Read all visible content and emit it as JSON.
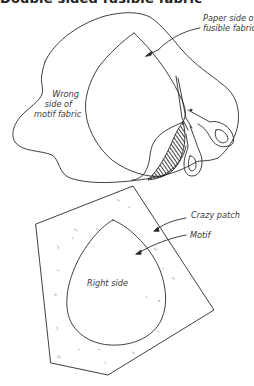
{
  "title": "Double sided fusible fabric",
  "figure_top": {
    "labels": {
      "paper_side": [
        "Paper side of",
        "fusible fabric"
      ],
      "wrong_side": [
        "Wrong",
        "side of",
        "motif fabric"
      ]
    }
  },
  "figure_bottom": {
    "labels": {
      "crazy_patch": "Crazy patch",
      "motif": "Motif",
      "right_side": "Right side"
    }
  },
  "colors": {
    "line": "#2a2a2a",
    "text": "#3a3a3a",
    "background": "#ffffff"
  }
}
